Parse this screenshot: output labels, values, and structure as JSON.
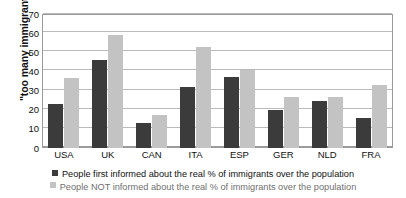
{
  "chart_data": {
    "type": "bar",
    "title": "",
    "xlabel": "",
    "ylabel": "\"too many immigrants\"",
    "ylim": [
      0,
      70
    ],
    "ytick_values": [
      70,
      60,
      50,
      40,
      30,
      20,
      10,
      0
    ],
    "ytick_labels": [
      "70",
      "60",
      "50",
      "40",
      "30",
      "20",
      "10",
      "0"
    ],
    "grid": true,
    "legend_position": "bottom",
    "categories": [
      "USA",
      "UK",
      "CAN",
      "ITA",
      "ESP",
      "GER",
      "NLD",
      "FRA"
    ],
    "series": [
      {
        "name": "People first informed about the real % of immigrants over the population",
        "color": "#3b3b3b",
        "values": [
          23,
          46,
          13,
          32,
          37,
          20,
          24.5,
          15.5
        ]
      },
      {
        "name": "People NOT informed about the real % of immigrants over the population",
        "color": "#c3c3c3",
        "values": [
          36.5,
          59,
          17.5,
          53,
          41,
          26.5,
          26.5,
          33
        ]
      }
    ]
  },
  "legend": {
    "line1": "People first informed about the real % of immigrants over the population",
    "line2": "People NOT informed about the real % of immigrants over the population"
  },
  "colors": {
    "series_informed": "#3b3b3b",
    "series_not_informed": "#c3c3c3",
    "gridline": "#b9b9b9",
    "axis": "#9a9a9a",
    "text": "#111111",
    "background": "#ffffff"
  }
}
